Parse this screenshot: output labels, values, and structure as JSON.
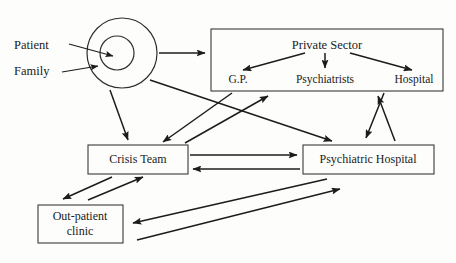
{
  "diagram": {
    "background_color": "#fdfdfc",
    "line_color": "#1c1c1c",
    "text_color": "#1a1a1a",
    "actors": {
      "patient_label": "Patient",
      "family_label": "Family"
    },
    "private_sector": {
      "title": "Private Sector",
      "children": [
        {
          "label": "G.P."
        },
        {
          "label": "Psychiatrists"
        },
        {
          "label": "Hospital"
        }
      ]
    },
    "services": [
      {
        "label": "Crisis Team"
      },
      {
        "label": "Psychiatric Hospital"
      },
      {
        "label_line1": "Out-patient",
        "label_line2": "clinic"
      }
    ],
    "connections": [
      {
        "from": "patient",
        "to": "core",
        "direction": "one-way"
      },
      {
        "from": "family",
        "to": "core",
        "direction": "one-way"
      },
      {
        "from": "core",
        "to": "private-sector",
        "direction": "one-way"
      },
      {
        "from": "private-sector",
        "to": "g.p.",
        "direction": "one-way"
      },
      {
        "from": "private-sector",
        "to": "psychiatrists",
        "direction": "one-way"
      },
      {
        "from": "private-sector",
        "to": "hospital",
        "direction": "one-way"
      },
      {
        "from": "core",
        "to": "crisis-team",
        "direction": "one-way"
      },
      {
        "from": "core",
        "to": "psychiatric-hospital",
        "direction": "one-way"
      },
      {
        "from": "crisis-team",
        "to": "private-sector",
        "direction": "one-way"
      },
      {
        "from": "private-sector",
        "to": "crisis-team",
        "direction": "one-way"
      },
      {
        "from": "crisis-team",
        "to": "psychiatric-hospital",
        "direction": "two-way"
      },
      {
        "from": "psychiatric-hospital",
        "to": "private-sector",
        "direction": "two-way"
      },
      {
        "from": "crisis-team",
        "to": "out-patient-clinic",
        "direction": "two-way"
      },
      {
        "from": "out-patient-clinic",
        "to": "psychiatric-hospital",
        "direction": "two-way"
      }
    ]
  }
}
